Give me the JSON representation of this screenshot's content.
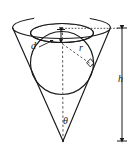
{
  "figure": {
    "background_color": "#ffffff",
    "stroke_color": "#1a1a1a",
    "dashed_color": "#555555",
    "width": 134,
    "height": 154
  },
  "labels": {
    "d": "d",
    "r": "r",
    "h": "h",
    "theta": "θ"
  },
  "annotations": {
    "right_angle": "right-angle-mark",
    "axis": "vertical-dashed-axis",
    "rim_line": "dotted-rim-line",
    "d_arrow": "vertical-double-arrow",
    "h_arrow": "height-dimension-arrow",
    "r_leader": "radius-dashed-leader",
    "d_leader": "d-leader-arrow"
  },
  "shapes": {
    "cone": "inverted-cone",
    "cone_rim_ellipse": "cone-rim-ellipse",
    "sphere": "inscribed-sphere",
    "sphere_top_ellipse": "sphere-top-ellipse",
    "apex": "cone-apex"
  }
}
